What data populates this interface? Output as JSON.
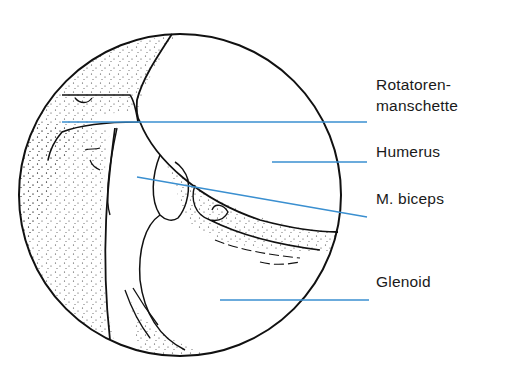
{
  "figure": {
    "leader_color": "#3a8fd0",
    "outline_color": "#111111"
  },
  "labels": [
    {
      "id": "rotatorenmanschette",
      "line1": "Rotatoren-",
      "line2": "manschette"
    },
    {
      "id": "humerus",
      "line1": "Humerus"
    },
    {
      "id": "biceps",
      "line1": "M. biceps"
    },
    {
      "id": "glenoid",
      "line1": "Glenoid"
    }
  ]
}
